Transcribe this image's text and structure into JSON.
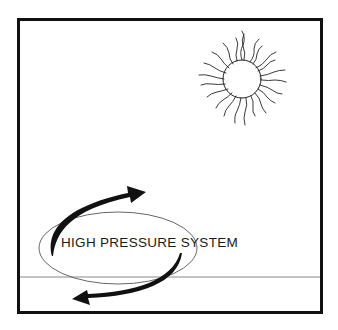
{
  "diagram": {
    "label": "HIGH PRESSURE SYSTEM",
    "elements": {
      "frame": {
        "stroke": "#111111"
      },
      "sun": {
        "stroke": "#222222"
      },
      "horizon": {
        "stroke": "#777777"
      },
      "pressure_ellipse": {
        "stroke": "#555555"
      },
      "arrows": {
        "fill": "#111111",
        "direction": "clockwise"
      }
    }
  }
}
